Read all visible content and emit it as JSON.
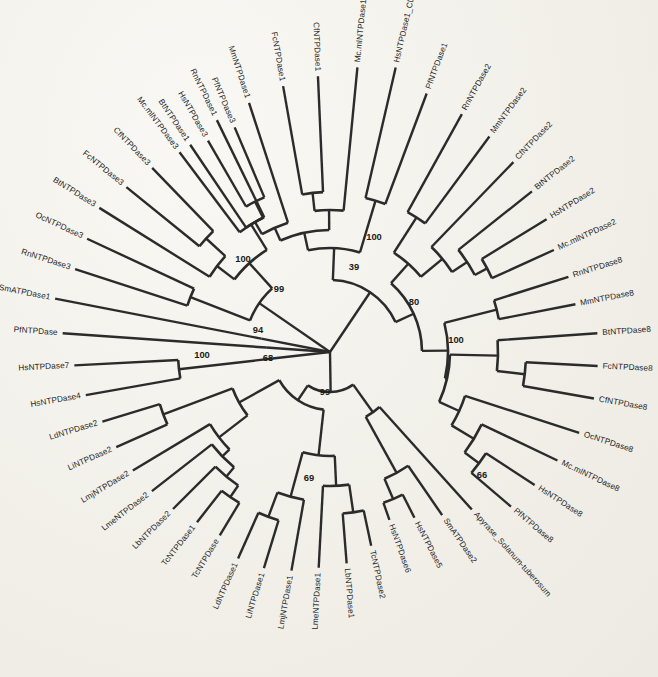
{
  "figure": {
    "type": "phylogenetic-tree",
    "layout": "circular-unrooted",
    "center": {
      "x": 330,
      "y": 352
    },
    "ghost_text": "                                                                  \n                                                                  \n                                                                  \n                                                                  \n                                                                  \n                                                                  \n                                                                  "
  },
  "leaves": [
    {
      "id": "MmNTPDase1",
      "label": "MmNTPDase1",
      "angle": -108.0,
      "radius": 262,
      "asterisk": false
    },
    {
      "id": "RnNTPDase1",
      "label": "RnNTPDase1",
      "angle": -116.0,
      "radius": 258,
      "asterisk": false
    },
    {
      "id": "BtNTPDase1",
      "label": "BtNTPDase1",
      "angle": -124.0,
      "radius": 250,
      "asterisk": false
    },
    {
      "id": "FcNTPDase1",
      "label": "FcNTPDase1",
      "angle": -100.0,
      "radius": 270,
      "asterisk": false
    },
    {
      "id": "CfNTPDase1",
      "label": "CfNTPDase1",
      "angle": -92.5,
      "radius": 276,
      "asterisk": false
    },
    {
      "id": "Mc.mlNTPDase1",
      "label": "Mc.mlNTPDase1",
      "angle": -84.5,
      "radius": 286,
      "asterisk": false
    },
    {
      "id": "HsNTPDase1_CD39",
      "label": "HsNTPDase1_CD39",
      "angle": -77.0,
      "radius": 292,
      "asterisk": true
    },
    {
      "id": "PfNTPDase1",
      "label": "PfNTPDase1",
      "angle": -69.5,
      "radius": 276,
      "asterisk": false
    },
    {
      "id": "RnNTPDase2",
      "label": "RnNTPDase2",
      "angle": -61.0,
      "radius": 272,
      "asterisk": false
    },
    {
      "id": "MmNTPDase2",
      "label": "MmNTPDase2",
      "angle": -53.5,
      "radius": 268,
      "asterisk": false
    },
    {
      "id": "CfNTPDase2",
      "label": "CfNTPDase2",
      "angle": -46.0,
      "radius": 264,
      "asterisk": false
    },
    {
      "id": "BtNTPDase2",
      "label": "BtNTPDase2",
      "angle": -38.5,
      "radius": 258,
      "asterisk": false
    },
    {
      "id": "HsNTPDase2",
      "label": "HsNTPDase2",
      "angle": -31.5,
      "radius": 254,
      "asterisk": false
    },
    {
      "id": "Mc.mlNTPDase2",
      "label": "Mc.mlNTPDase2",
      "angle": -24.5,
      "radius": 246,
      "asterisk": false
    },
    {
      "id": "RnNTPDase8",
      "label": "RnNTPDase8",
      "angle": -17.5,
      "radius": 250,
      "asterisk": false
    },
    {
      "id": "MmNTPDase8",
      "label": "MmNTPDase8",
      "angle": -11.0,
      "radius": 250,
      "asterisk": false
    },
    {
      "id": "BtNTPDase8",
      "label": "BtNTPDase8",
      "angle": -4.0,
      "radius": 268,
      "asterisk": false
    },
    {
      "id": "FcNTPDase8",
      "label": "FcNTPDase8",
      "angle": 3.0,
      "radius": 268,
      "asterisk": false
    },
    {
      "id": "CfNTPDase8",
      "label": "CfNTPDase8",
      "angle": 10.0,
      "radius": 268,
      "asterisk": false
    },
    {
      "id": "OcNTPDase8",
      "label": "OcNTPDase8",
      "angle": 18.0,
      "radius": 262,
      "asterisk": false
    },
    {
      "id": "Mc.mlNTPDase8",
      "label": "Mc.mlNTPDase8",
      "angle": 25.5,
      "radius": 252,
      "asterisk": false
    },
    {
      "id": "HsNTPDase8",
      "label": "HsNTPDase8",
      "angle": 33.0,
      "radius": 244,
      "asterisk": false
    },
    {
      "id": "PfNTPDase8",
      "label": "PfNTPDase8",
      "angle": 40.5,
      "radius": 238,
      "asterisk": false
    },
    {
      "id": "Apyrase_Solanum",
      "label": "Apyrase_Solanum-tuberosum",
      "angle": 48.0,
      "radius": 212,
      "asterisk": false
    },
    {
      "id": "SmATPDase2",
      "label": "SmATPDase2",
      "angle": 55.5,
      "radius": 198,
      "asterisk": false
    },
    {
      "id": "HsNTPDase5",
      "label": "HsNTPDase5",
      "angle": 63.0,
      "radius": 186,
      "asterisk": false
    },
    {
      "id": "HsNTPDase6",
      "label": "HsNTPDase6",
      "angle": 70.5,
      "radius": 178,
      "asterisk": false
    },
    {
      "id": "TcNTPDase2",
      "label": "TcNTPDase2",
      "angle": 78.0,
      "radius": 198,
      "asterisk": false
    },
    {
      "id": "LbNTPDase1",
      "label": "LbNTPDase1",
      "angle": 85.5,
      "radius": 212,
      "asterisk": false
    },
    {
      "id": "LmeNTPDase1",
      "label": "LmeNTPDase1",
      "angle": 93.0,
      "radius": 216,
      "asterisk": false
    },
    {
      "id": "LmjNTPDase1",
      "label": "LmjNTPDase1",
      "angle": 100.0,
      "radius": 222,
      "asterisk": false
    },
    {
      "id": "LiNTPDase1",
      "label": "LiNTPDase1",
      "angle": 107.0,
      "radius": 226,
      "asterisk": false
    },
    {
      "id": "LdNTPDase1",
      "label": "LdNTPDase1",
      "angle": 114.0,
      "radius": 226,
      "asterisk": false
    },
    {
      "id": "TcNTPDase",
      "label": "TcNTPDase",
      "angle": 121.0,
      "radius": 214,
      "asterisk": false
    },
    {
      "id": "TcNTPDase1",
      "label": "TcNTPDase1",
      "angle": 128.0,
      "radius": 216,
      "asterisk": false
    },
    {
      "id": "LbNTPDase2",
      "label": "LbNTPDase2",
      "angle": 135.0,
      "radius": 222,
      "asterisk": false
    },
    {
      "id": "LmeNTPDase2",
      "label": "LmeNTPDase2",
      "angle": 142.0,
      "radius": 226,
      "asterisk": false
    },
    {
      "id": "LmjNTPDase2",
      "label": "LmjNTPDase2",
      "angle": 149.0,
      "radius": 230,
      "asterisk": false
    },
    {
      "id": "LiNTPDase2",
      "label": "LiNTPDase2",
      "angle": 156.0,
      "radius": 234,
      "asterisk": false
    },
    {
      "id": "LdNTPDase2",
      "label": "LdNTPDase2",
      "angle": 163.0,
      "radius": 238,
      "asterisk": false
    },
    {
      "id": "HsNTPDase4",
      "label": "HsNTPDase4",
      "angle": 170.0,
      "radius": 248,
      "asterisk": false
    },
    {
      "id": "HsNTPDase7",
      "label": "HsNTPDase7",
      "angle": 177.0,
      "radius": 256,
      "asterisk": false
    },
    {
      "id": "PfNTPDase",
      "label": "PfNTPDase",
      "angle": 184.0,
      "radius": 268,
      "asterisk": false
    },
    {
      "id": "SmATPDase1",
      "label": "SmATPDase1",
      "angle": 191.0,
      "radius": 280,
      "asterisk": true
    },
    {
      "id": "RnNTPDase3",
      "label": "RnNTPDase3",
      "angle": 198.0,
      "radius": 268,
      "asterisk": false
    },
    {
      "id": "OcNTPDase3",
      "label": "OcNTPDase3",
      "angle": 205.0,
      "radius": 268,
      "asterisk": false
    },
    {
      "id": "BtNTPDase3",
      "label": "BtNTPDase3",
      "angle": 212.0,
      "radius": 272,
      "asterisk": false
    },
    {
      "id": "FcNTPDase3",
      "label": "FcNTPDase3",
      "angle": 219.0,
      "radius": 262,
      "asterisk": false
    },
    {
      "id": "CfNTPDase3",
      "label": "CfNTPDase3",
      "angle": 226.0,
      "radius": 256,
      "asterisk": false
    },
    {
      "id": "Mc.mlNTPDase3",
      "label": "Mc.mlNTPDase3",
      "angle": 233.0,
      "radius": 250,
      "asterisk": false
    },
    {
      "id": "HsNTPDase3",
      "label": "HsNTPDase3",
      "angle": 240.0,
      "radius": 244,
      "asterisk": false
    },
    {
      "id": "PfNTPDase3",
      "label": "PfNTPDase3",
      "angle": 247.0,
      "radius": 244,
      "asterisk": false
    }
  ],
  "bootstrap_values": [
    {
      "value": "100",
      "x": 243,
      "y": 262
    },
    {
      "value": "39",
      "x": 354,
      "y": 270
    },
    {
      "value": "99",
      "x": 279,
      "y": 292
    },
    {
      "value": "80",
      "x": 414,
      "y": 305
    },
    {
      "value": "100",
      "x": 374,
      "y": 240
    },
    {
      "value": "100",
      "x": 456,
      "y": 343
    },
    {
      "value": "94",
      "x": 258,
      "y": 333
    },
    {
      "value": "68",
      "x": 268,
      "y": 361
    },
    {
      "value": "100",
      "x": 202,
      "y": 358
    },
    {
      "value": "99",
      "x": 325,
      "y": 395
    },
    {
      "value": "69",
      "x": 309,
      "y": 481
    },
    {
      "value": "66",
      "x": 482,
      "y": 478
    }
  ],
  "legend": {
    "asterisk_symbol": "*",
    "asterisk_note": ""
  }
}
